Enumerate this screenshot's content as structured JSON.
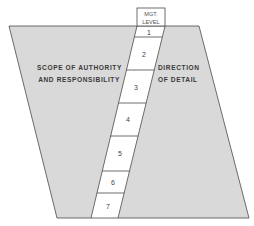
{
  "diagram": {
    "header": {
      "line1": "MGT.",
      "line2": "LEVEL"
    },
    "left_label": {
      "line1": "SCOPE OF AUTHORITY",
      "line2": "AND RESPONSIBILITY"
    },
    "right_label": {
      "line1": "DIRECTION",
      "line2": "OF DETAIL"
    },
    "levels": [
      "1",
      "2",
      "3",
      "4",
      "5",
      "6",
      "7"
    ],
    "colors": {
      "shade": "#d9d9d9",
      "line": "#4a4a4a",
      "strip": "#ffffff"
    }
  }
}
